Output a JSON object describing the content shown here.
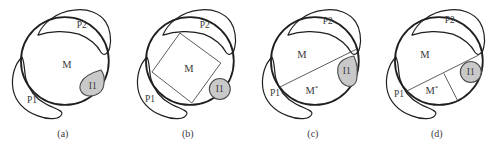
{
  "figure": {
    "colors": {
      "background": "#ffffff",
      "outline": "#1f1f1f",
      "thin_line": "#4a4a4a",
      "text": "#383838",
      "shade_fill": "#c9c9c9",
      "shade_outline": "#4a4a4a"
    },
    "panels": [
      {
        "caption": "(a)",
        "labels": {
          "p2": "P2",
          "m": "M",
          "p1": "P1",
          "i1": "I1"
        }
      },
      {
        "caption": "(b)",
        "labels": {
          "p2": "P2",
          "m": "M",
          "p1": "P1",
          "i1": "I1"
        }
      },
      {
        "caption": "(c)",
        "labels": {
          "p2": "P2",
          "m": "M",
          "m_star_base": "M",
          "m_star_sup": "*",
          "p1": "P1",
          "i1": "I1"
        }
      },
      {
        "caption": "(d)",
        "labels": {
          "p2": "P2",
          "m": "M",
          "m_star_base": "M",
          "m_star_sup": "*",
          "p1": "P1",
          "i1": "I1"
        }
      }
    ]
  }
}
